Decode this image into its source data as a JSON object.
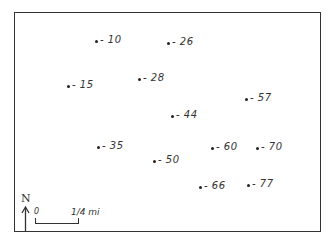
{
  "map": {
    "points": [
      {
        "label": "-10",
        "x": 96,
        "y": 41
      },
      {
        "label": "-26",
        "x": 168,
        "y": 43
      },
      {
        "label": "-15",
        "x": 68,
        "y": 86
      },
      {
        "label": "-28",
        "x": 139,
        "y": 79
      },
      {
        "label": "-57",
        "x": 246,
        "y": 99
      },
      {
        "label": "-44",
        "x": 172,
        "y": 116
      },
      {
        "label": "-35",
        "x": 98,
        "y": 147
      },
      {
        "label": "-50",
        "x": 154,
        "y": 161
      },
      {
        "label": "-60",
        "x": 212,
        "y": 148
      },
      {
        "label": "-70",
        "x": 257,
        "y": 148
      },
      {
        "label": "-66",
        "x": 200,
        "y": 187
      },
      {
        "label": "-77",
        "x": 248,
        "y": 185
      }
    ],
    "north_arrow": {
      "label": "N"
    },
    "scale_bar": {
      "start_label": "0",
      "end_label": "1/4 mi"
    }
  }
}
